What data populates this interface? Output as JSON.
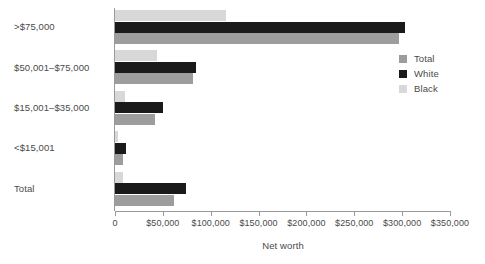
{
  "chart_data": {
    "type": "bar",
    "orientation": "horizontal",
    "title": "",
    "xlabel": "Net worth",
    "ylabel": "",
    "xlim": [
      0,
      350000
    ],
    "grid": false,
    "legend_position": "right",
    "categories": [
      "Total",
      "<$15,001",
      "$15,001–$35,000",
      "$50,001–$75,000",
      ">$75,000"
    ],
    "series": [
      {
        "name": "Total",
        "color": "#9d9d9d",
        "values": [
          61500,
          8000,
          42000,
          81500,
          297000
        ]
      },
      {
        "name": "White",
        "color": "#1a1a1a",
        "values": [
          74000,
          11000,
          50000,
          85000,
          303000
        ]
      },
      {
        "name": "Black",
        "color": "#d8d8d8",
        "values": [
          8500,
          3000,
          10500,
          44000,
          116000
        ]
      }
    ],
    "xticks": [
      0,
      50000,
      100000,
      150000,
      200000,
      250000,
      300000,
      350000
    ],
    "xtick_labels": [
      "0",
      "$50,000",
      "$100,000",
      "$150,000",
      "$200,000",
      "$250,000",
      "$300,000",
      "$350,000"
    ]
  },
  "legend": {
    "items": [
      {
        "label": "Total",
        "color": "#9d9d9d"
      },
      {
        "label": "White",
        "color": "#1a1a1a"
      },
      {
        "label": "Black",
        "color": "#d8d8d8"
      }
    ]
  },
  "axes": {
    "x_title": "Net worth"
  }
}
